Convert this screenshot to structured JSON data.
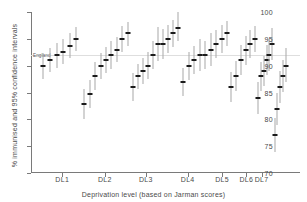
{
  "chart_data": {
    "type": "scatter",
    "title": "",
    "xlabel": "Deprivation level (based on Jarman scores)",
    "ylabel": "% immunised and 95% confidence intervals",
    "ylim": [
      70,
      100
    ],
    "yticks": [
      70,
      75,
      80,
      85,
      90,
      95,
      100
    ],
    "grid": false,
    "legend": "none",
    "annotations": [
      {
        "text": "England",
        "y": 92.0,
        "x_frac": 0.028,
        "type": "reference-line-label"
      }
    ],
    "categories": [
      "DL1",
      "DL2",
      "DL3",
      "DL4",
      "DL5",
      "DL6",
      "DL7"
    ],
    "category_centers_frac": [
      0.115,
      0.295,
      0.468,
      0.645,
      0.79,
      0.893,
      0.957
    ],
    "series": [
      {
        "name": "District immunisation rate with 95% CI",
        "point_label": "estimate",
        "error_label": "95% confidence interval",
        "groups": [
          {
            "category": "DL1",
            "points": [
              {
                "x_frac": 0.035,
                "value": 90.0,
                "low": 87.6,
                "high": 92.4
              },
              {
                "x_frac": 0.063,
                "value": 91.0,
                "low": 88.8,
                "high": 93.2
              },
              {
                "x_frac": 0.091,
                "value": 92.0,
                "low": 89.6,
                "high": 94.3
              },
              {
                "x_frac": 0.119,
                "value": 92.6,
                "low": 90.3,
                "high": 95.0
              },
              {
                "x_frac": 0.147,
                "value": 93.7,
                "low": 91.5,
                "high": 96.0
              },
              {
                "x_frac": 0.175,
                "value": 95.0,
                "low": 92.7,
                "high": 97.2
              }
            ]
          },
          {
            "category": "DL2",
            "points": [
              {
                "x_frac": 0.208,
                "value": 82.8,
                "low": 80.0,
                "high": 85.6
              },
              {
                "x_frac": 0.231,
                "value": 84.8,
                "low": 82.2,
                "high": 87.4
              },
              {
                "x_frac": 0.254,
                "value": 88.0,
                "low": 85.4,
                "high": 90.6
              },
              {
                "x_frac": 0.277,
                "value": 90.0,
                "low": 87.6,
                "high": 92.4
              },
              {
                "x_frac": 0.3,
                "value": 91.0,
                "low": 88.6,
                "high": 93.4
              },
              {
                "x_frac": 0.323,
                "value": 92.0,
                "low": 89.4,
                "high": 94.6
              },
              {
                "x_frac": 0.346,
                "value": 93.0,
                "low": 90.6,
                "high": 95.4
              },
              {
                "x_frac": 0.369,
                "value": 95.0,
                "low": 92.6,
                "high": 97.3
              },
              {
                "x_frac": 0.392,
                "value": 96.0,
                "low": 93.7,
                "high": 98.2
              }
            ]
          },
          {
            "category": "DL3",
            "points": [
              {
                "x_frac": 0.415,
                "value": 86.0,
                "low": 83.4,
                "high": 88.6
              },
              {
                "x_frac": 0.436,
                "value": 88.0,
                "low": 85.6,
                "high": 90.4
              },
              {
                "x_frac": 0.457,
                "value": 89.0,
                "low": 86.5,
                "high": 91.5
              },
              {
                "x_frac": 0.478,
                "value": 90.0,
                "low": 87.5,
                "high": 92.5
              },
              {
                "x_frac": 0.499,
                "value": 92.0,
                "low": 89.4,
                "high": 94.6
              },
              {
                "x_frac": 0.52,
                "value": 94.0,
                "low": 90.8,
                "high": 97.2
              },
              {
                "x_frac": 0.541,
                "value": 94.0,
                "low": 91.2,
                "high": 96.8
              },
              {
                "x_frac": 0.562,
                "value": 95.0,
                "low": 92.4,
                "high": 97.6
              },
              {
                "x_frac": 0.583,
                "value": 96.0,
                "low": 93.4,
                "high": 98.6
              },
              {
                "x_frac": 0.604,
                "value": 97.0,
                "low": 94.6,
                "high": 100.0
              }
            ]
          },
          {
            "category": "DL4",
            "points": [
              {
                "x_frac": 0.627,
                "value": 87.0,
                "low": 84.4,
                "high": 89.6
              },
              {
                "x_frac": 0.65,
                "value": 90.0,
                "low": 87.4,
                "high": 92.6
              },
              {
                "x_frac": 0.673,
                "value": 91.0,
                "low": 88.4,
                "high": 93.6
              },
              {
                "x_frac": 0.696,
                "value": 92.0,
                "low": 89.0,
                "high": 95.0
              },
              {
                "x_frac": 0.719,
                "value": 92.0,
                "low": 89.4,
                "high": 94.6
              },
              {
                "x_frac": 0.742,
                "value": 93.0,
                "low": 90.0,
                "high": 96.0
              },
              {
                "x_frac": 0.765,
                "value": 94.0,
                "low": 91.4,
                "high": 96.6
              },
              {
                "x_frac": 0.788,
                "value": 95.0,
                "low": 92.4,
                "high": 97.6
              },
              {
                "x_frac": 0.811,
                "value": 96.0,
                "low": 93.6,
                "high": 98.4
              }
            ]
          },
          {
            "category": "DL5",
            "points": [
              {
                "x_frac": 0.83,
                "value": 86.0,
                "low": 83.2,
                "high": 88.8
              },
              {
                "x_frac": 0.85,
                "value": 88.0,
                "low": 85.2,
                "high": 90.8
              },
              {
                "x_frac": 0.87,
                "value": 91.0,
                "low": 88.2,
                "high": 93.8
              },
              {
                "x_frac": 0.89,
                "value": 93.0,
                "low": 90.2,
                "high": 95.6
              },
              {
                "x_frac": 0.91,
                "value": 94.0,
                "low": 91.4,
                "high": 96.6
              },
              {
                "x_frac": 0.928,
                "value": 95.0,
                "low": 92.6,
                "high": 97.4
              }
            ]
          },
          {
            "category": "DL6",
            "points": [
              {
                "x_frac": 0.944,
                "value": 84.0,
                "low": 81.0,
                "high": 87.0
              },
              {
                "x_frac": 0.956,
                "value": 88.0,
                "low": 85.2,
                "high": 90.6
              },
              {
                "x_frac": 0.967,
                "value": 89.0,
                "low": 86.2,
                "high": 91.8
              },
              {
                "x_frac": 0.978,
                "value": 91.0,
                "low": 88.2,
                "high": 93.8
              },
              {
                "x_frac": 0.989,
                "value": 92.0,
                "low": 89.0,
                "high": 95.0
              },
              {
                "x_frac": 1.0,
                "value": 94.0,
                "low": 91.0,
                "high": 97.0
              }
            ]
          },
          {
            "category": "DL7",
            "points": [
              {
                "x_frac": 1.012,
                "value": 77.0,
                "low": 74.0,
                "high": 80.2
              },
              {
                "x_frac": 1.024,
                "value": 82.0,
                "low": 79.0,
                "high": 85.0
              },
              {
                "x_frac": 1.036,
                "value": 86.0,
                "low": 83.0,
                "high": 89.0
              },
              {
                "x_frac": 1.048,
                "value": 88.0,
                "low": 85.0,
                "high": 91.0
              },
              {
                "x_frac": 1.06,
                "value": 90.0,
                "low": 87.0,
                "high": 93.2
              }
            ]
          }
        ]
      }
    ]
  },
  "axes": {
    "y": {
      "label": "% immunised and 95% confidence intervals",
      "tick_labels": [
        "100",
        "95",
        "90",
        "85",
        "80",
        "75",
        "70"
      ]
    },
    "x": {
      "label": "Deprivation level (based on Jarman scores)",
      "tick_labels": [
        "DL1",
        "DL2",
        "DL3",
        "DL4",
        "DL5",
        "DL6",
        "DL7"
      ]
    }
  },
  "reference": {
    "england_label": "England",
    "england_value": 92.0
  },
  "colors": {
    "point": "#1b1b1b",
    "whisker": "#a8a8a8",
    "axis": "#7a7a7a",
    "reference_line": "#dedede",
    "text": "#4a4a4a",
    "background": "#ffffff"
  }
}
